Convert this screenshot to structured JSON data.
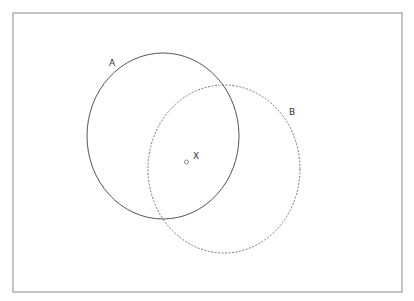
{
  "diagram": {
    "type": "venn-2-sets",
    "colors": {
      "frame": "#8a8a8a",
      "set_a_stroke": "#555555",
      "set_b_stroke": "#777777",
      "point": "#888888",
      "label": "#333333"
    },
    "sets": [
      {
        "id": "A",
        "label": "A",
        "line_style": "solid"
      },
      {
        "id": "B",
        "label": "B",
        "line_style": "dashed"
      }
    ],
    "point": {
      "label": "X",
      "location": "intersection of A and B"
    }
  }
}
